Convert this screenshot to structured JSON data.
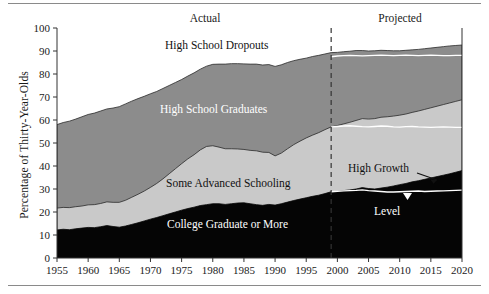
{
  "chart_data": {
    "type": "area",
    "title": "",
    "subtitle": "",
    "xlabel": "",
    "ylabel": "Percentage of Thirty-Year-Olds",
    "xlim": [
      1955,
      2020
    ],
    "ylim": [
      0,
      100
    ],
    "grid": false,
    "legend_position": "inline-labels",
    "stacked": true,
    "x_ticks": [
      1955,
      1960,
      1965,
      1970,
      1975,
      1980,
      1985,
      1990,
      1995,
      2000,
      2005,
      2010,
      2015,
      2020
    ],
    "y_ticks": [
      0,
      10,
      20,
      30,
      40,
      50,
      60,
      70,
      80,
      90,
      100
    ],
    "x": [
      1955,
      1956,
      1957,
      1958,
      1959,
      1960,
      1961,
      1962,
      1963,
      1964,
      1965,
      1966,
      1967,
      1968,
      1969,
      1970,
      1971,
      1972,
      1973,
      1974,
      1975,
      1976,
      1977,
      1978,
      1979,
      1980,
      1981,
      1982,
      1983,
      1984,
      1985,
      1986,
      1987,
      1988,
      1989,
      1990,
      1991,
      1992,
      1993,
      1994,
      1995,
      1996,
      1997,
      1998,
      1999,
      2000,
      2001,
      2002,
      2003,
      2004,
      2005,
      2006,
      2007,
      2008,
      2009,
      2010,
      2011,
      2012,
      2013,
      2014,
      2015,
      2016,
      2017,
      2018,
      2019,
      2020
    ],
    "series": [
      {
        "name": "College Graduate or More",
        "color": "#050505",
        "label_color": "#ffffff",
        "values": [
          12.2,
          12.5,
          12.3,
          12.7,
          13.0,
          13.3,
          13.2,
          13.6,
          14.1,
          13.7,
          13.4,
          13.9,
          14.6,
          15.3,
          16.1,
          16.9,
          17.6,
          18.4,
          19.2,
          20.0,
          20.8,
          21.5,
          22.1,
          22.8,
          23.2,
          23.6,
          23.6,
          23.3,
          23.6,
          23.9,
          24.0,
          23.6,
          23.2,
          22.9,
          23.3,
          23.0,
          23.6,
          24.3,
          25.0,
          25.6,
          26.2,
          26.8,
          27.3,
          28.0,
          28.8,
          29.0,
          29.3,
          29.6,
          30.0,
          30.6,
          30.2,
          30.0,
          30.4,
          30.8,
          31.3,
          31.9,
          32.4,
          33.1,
          33.6,
          34.2,
          34.8,
          35.4,
          36.0,
          36.6,
          37.3,
          38.0
        ]
      },
      {
        "name": "Some Advanced Schooling",
        "color": "#c9c9c9",
        "label_color": "#111111",
        "values": [
          9.5,
          9.5,
          9.6,
          9.6,
          9.6,
          9.8,
          10.0,
          10.1,
          10.3,
          10.5,
          10.8,
          11.2,
          11.8,
          12.4,
          13.0,
          13.8,
          14.8,
          16.0,
          17.4,
          18.8,
          20.2,
          21.6,
          22.8,
          24.2,
          25.3,
          25.2,
          24.6,
          24.2,
          23.9,
          23.5,
          23.2,
          23.2,
          23.4,
          23.1,
          22.6,
          21.4,
          22.0,
          23.2,
          24.3,
          25.2,
          26.0,
          26.6,
          27.2,
          27.8,
          28.2,
          28.6,
          29.0,
          29.4,
          29.8,
          30.0,
          30.2,
          30.6,
          30.8,
          30.6,
          30.4,
          30.2,
          30.2,
          30.2,
          30.3,
          30.4,
          30.5,
          30.6,
          30.7,
          30.8,
          30.8,
          30.8
        ]
      },
      {
        "name": "High School Graduates",
        "color": "#8c8c8c",
        "label_color": "#ffffff",
        "values": [
          36.3,
          36.9,
          37.6,
          38.1,
          38.8,
          39.3,
          39.8,
          40.2,
          40.4,
          41.0,
          41.6,
          41.9,
          41.8,
          41.6,
          41.2,
          40.7,
          40.0,
          39.3,
          38.4,
          37.5,
          36.6,
          36.0,
          35.6,
          35.1,
          34.9,
          35.4,
          36.1,
          36.8,
          37.0,
          37.1,
          37.2,
          37.5,
          37.7,
          37.9,
          38.2,
          38.9,
          38.4,
          37.5,
          36.5,
          35.6,
          34.7,
          34.2,
          33.6,
          32.9,
          32.3,
          31.8,
          31.4,
          30.9,
          30.4,
          29.6,
          29.6,
          29.5,
          29.1,
          28.8,
          28.4,
          28.0,
          27.7,
          27.2,
          26.8,
          26.4,
          26.0,
          25.6,
          25.2,
          24.8,
          24.3,
          23.8
        ]
      },
      {
        "name": "High School Dropouts",
        "color": "#ffffff",
        "label_color": "#111111",
        "values": [
          42.0,
          41.1,
          40.5,
          39.6,
          38.6,
          37.6,
          37.0,
          36.1,
          35.2,
          34.8,
          34.2,
          33.0,
          31.8,
          30.7,
          29.7,
          28.6,
          27.6,
          26.3,
          25.0,
          23.7,
          22.4,
          20.9,
          19.5,
          17.9,
          16.6,
          15.8,
          15.7,
          15.7,
          15.5,
          15.5,
          15.6,
          15.7,
          15.7,
          16.1,
          15.9,
          16.7,
          16.0,
          15.0,
          14.2,
          13.6,
          13.1,
          12.4,
          11.9,
          11.3,
          10.7,
          10.6,
          10.3,
          10.1,
          9.8,
          9.8,
          10.0,
          9.9,
          9.7,
          9.8,
          9.9,
          9.9,
          9.7,
          9.5,
          9.3,
          9.0,
          8.7,
          8.4,
          8.1,
          7.8,
          7.6,
          7.4
        ]
      }
    ],
    "scenario_lines": {
      "name": "Level",
      "color": "#ffffff",
      "description": "Level scenario boundaries shown as white lines over the projected region",
      "college_graduate_or_more": [
        28.8,
        29.0,
        29.2,
        29.3,
        29.4,
        29.6,
        29.3,
        29.1,
        28.9,
        28.7,
        28.7,
        28.8,
        28.9,
        29.0,
        29.1,
        28.9,
        29.0,
        29.1,
        29.2,
        29.3,
        29.4,
        29.5
      ],
      "cumulative_some_advanced": [
        57.0,
        57.2,
        57.4,
        57.5,
        57.3,
        57.1,
        57.0,
        57.2,
        57.4,
        57.3,
        57.0,
        56.9,
        57.1,
        57.2,
        57.0,
        56.9,
        56.8,
        56.9,
        57.0,
        56.9,
        56.8,
        56.8
      ],
      "cumulative_high_school_graduates": [
        87.5,
        87.8,
        88.0,
        88.1,
        88.0,
        87.9,
        88.0,
        88.1,
        88.2,
        88.1,
        88.0,
        88.1,
        88.2,
        88.1,
        88.0,
        88.1,
        88.2,
        88.1,
        88.0,
        88.0,
        88.1,
        88.1
      ]
    },
    "annotations": [
      {
        "name": "actual-label",
        "text": "Actual",
        "x": 1978,
        "y": 98
      },
      {
        "name": "projected-label",
        "text": "Projected",
        "x": 2010,
        "y": 98
      },
      {
        "name": "divider",
        "text": "",
        "x": 1999,
        "y": 100,
        "style": "dashed-vertical"
      },
      {
        "name": "high-growth-label",
        "text": "High Growth",
        "x": 2010,
        "y": 40
      },
      {
        "name": "level-label",
        "text": "Level",
        "x": 2011,
        "y": 22
      }
    ]
  },
  "chart": {
    "y_axis_title": "Percentage of Thirty-Year-Olds",
    "period_actual": "Actual",
    "period_projected": "Projected",
    "divider_year": "1999",
    "band_labels": {
      "dropouts": "High School Dropouts",
      "graduates": "High School Graduates",
      "some_advanced": "Some Advanced Schooling",
      "college": "College Graduate or More"
    },
    "scenario_labels": {
      "high_growth": "High Growth",
      "level": "Level"
    },
    "x_tick_labels": [
      "1955",
      "1960",
      "1965",
      "1970",
      "1975",
      "1980",
      "1985",
      "1990",
      "1995",
      "2000",
      "2005",
      "2010",
      "2015",
      "2020"
    ],
    "y_tick_labels": [
      "0",
      "10",
      "20",
      "30",
      "40",
      "50",
      "60",
      "70",
      "80",
      "90",
      "100"
    ],
    "colors": {
      "college": "#050505",
      "some_advanced": "#c9c9c9",
      "graduates": "#8c8c8c",
      "dropouts": "#ffffff",
      "axis": "#333333",
      "scenario_line": "#ffffff",
      "rule": "#8a8a8a"
    }
  }
}
